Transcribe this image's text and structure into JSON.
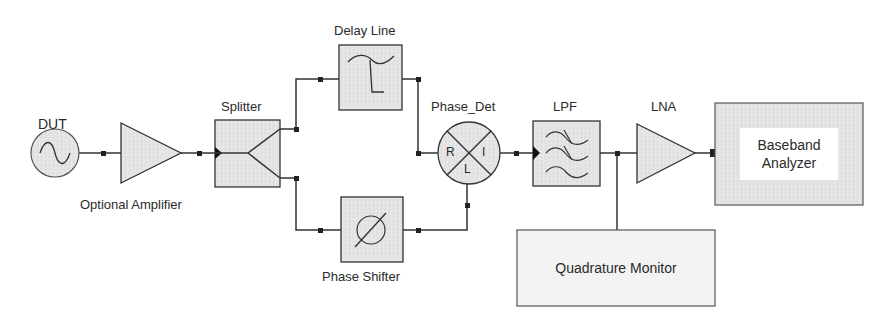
{
  "diagram": {
    "type": "block-diagram",
    "title": "",
    "colors": {
      "stroke": "#333333",
      "fill": "#e3e3e3",
      "inner_fill": "#ffffff",
      "background": "#ffffff"
    },
    "blocks": {
      "dut": {
        "label": "DUT",
        "icon": "sine-source-icon"
      },
      "amp": {
        "label": "Optional Amplifier",
        "icon": "amplifier-triangle-icon"
      },
      "splitter": {
        "label": "Splitter",
        "icon": "splitter-icon"
      },
      "delay": {
        "label": "Delay Line",
        "icon": "delay-line-icon"
      },
      "phase_shifter": {
        "label": "Phase Shifter",
        "icon": "phase-shift-icon"
      },
      "phase_det": {
        "label": "Phase_Det",
        "ports": {
          "r": "R",
          "i": "I",
          "l": "L"
        },
        "icon": "mixer-icon"
      },
      "lpf": {
        "label": "LPF",
        "icon": "lowpass-filter-icon"
      },
      "lna": {
        "label": "LNA",
        "icon": "amplifier-triangle-icon"
      },
      "baseband": {
        "label_line1": "Baseband",
        "label_line2": "Analyzer"
      },
      "quad_monitor": {
        "label": "Quadrature Monitor"
      }
    },
    "connections": [
      {
        "from": "DUT",
        "to": "Optional Amplifier"
      },
      {
        "from": "Optional Amplifier",
        "to": "Splitter"
      },
      {
        "from": "Splitter",
        "to": "Delay Line"
      },
      {
        "from": "Splitter",
        "to": "Phase Shifter"
      },
      {
        "from": "Delay Line",
        "to": "Phase_Det R"
      },
      {
        "from": "Phase Shifter",
        "to": "Phase_Det L"
      },
      {
        "from": "Phase_Det I",
        "to": "LPF"
      },
      {
        "from": "LPF",
        "to": "LNA"
      },
      {
        "from": "LPF",
        "to": "Quadrature Monitor"
      },
      {
        "from": "LNA",
        "to": "Baseband Analyzer"
      }
    ]
  }
}
